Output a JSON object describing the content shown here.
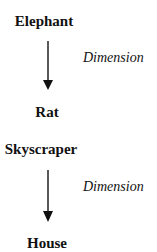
{
  "diagrams": [
    {
      "top": "Elephant",
      "relation": "Dimension",
      "bottom": "Rat"
    },
    {
      "top": "Skyscraper",
      "relation": "Dimension",
      "bottom": "House"
    }
  ]
}
